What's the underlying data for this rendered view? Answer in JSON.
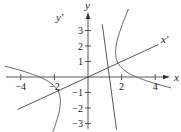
{
  "chart_data": {
    "type": "line",
    "title": "",
    "xlabel": "x",
    "ylabel": "y",
    "rotated_xlabel": "x'",
    "rotated_ylabel": "y'",
    "xlim": [
      -4.5,
      4.5
    ],
    "ylim": [
      -3.5,
      3.5
    ],
    "x_ticks": [
      -4,
      -2,
      2,
      4
    ],
    "x_tick_labels": [
      "−4",
      "−2",
      "2",
      "4"
    ],
    "y_ticks": [
      -3,
      -2,
      -1,
      1,
      2,
      3
    ],
    "y_tick_labels": [
      "−3",
      "−2",
      "−1",
      "1",
      "2",
      "3"
    ],
    "rotated_axes": {
      "x_prime_slope": 0.5,
      "y_prime_slope": -2
    },
    "series": [
      {
        "name": "hyperbola",
        "equation": "x'^2/4 - y'^2/2.5 = 1 (rotated by arctan(1/2))",
        "a2": 4,
        "b2": 2.5,
        "rotation_slope": 0.5
      }
    ],
    "grid": false,
    "legend": "none"
  }
}
